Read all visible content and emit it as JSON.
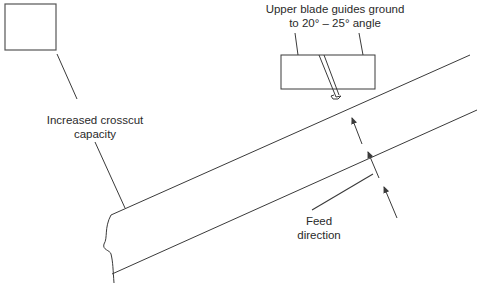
{
  "labels": {
    "blade_guides_line1": "Upper blade guides ground",
    "blade_guides_line2": "to 20° – 25° angle",
    "crosscut_line1": "Increased crosscut",
    "crosscut_line2": "capacity",
    "feed_line1": "Feed",
    "feed_line2": "direction"
  },
  "colors": {
    "stroke": "#3a3a3a",
    "text": "#2a2a2a",
    "background": "#ffffff"
  }
}
